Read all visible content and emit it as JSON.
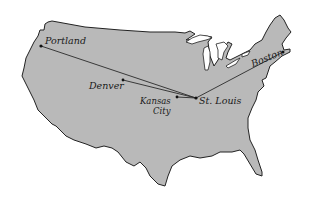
{
  "map": {
    "title": "Route map of the United States",
    "colors": {
      "land": "#b9b9b9",
      "outline": "#222222",
      "background": "#ffffff",
      "route": "#2a2a2a"
    },
    "cities": [
      {
        "name": "Portland",
        "x": 41,
        "y": 46
      },
      {
        "name": "Denver",
        "x": 123,
        "y": 80
      },
      {
        "name": "Kansas City",
        "line1": "Kansas",
        "line2": "City",
        "x": 177,
        "y": 97
      },
      {
        "name": "St. Louis",
        "x": 196,
        "y": 98
      },
      {
        "name": "Boston",
        "x": 283,
        "y": 52
      }
    ],
    "routes": [
      {
        "from": "Portland",
        "to": "St. Louis"
      },
      {
        "from": "Denver",
        "to": "St. Louis"
      },
      {
        "from": "Kansas City",
        "to": "St. Louis"
      },
      {
        "from": "St. Louis",
        "to": "Boston"
      }
    ]
  }
}
